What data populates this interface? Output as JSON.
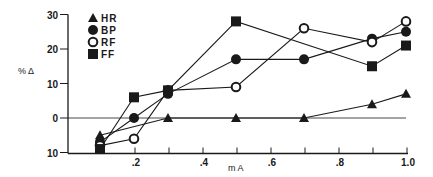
{
  "chart_data": {
    "type": "line",
    "title": "",
    "xlabel": "m A",
    "ylabel": "% Δ",
    "x": [
      0.1,
      0.2,
      0.3,
      0.5,
      0.7,
      0.9,
      1.0
    ],
    "xlim": [
      0.0,
      1.0
    ],
    "ylim": [
      -10,
      30
    ],
    "x_ticks": [
      ".2",
      ".4",
      ".6",
      ".8",
      "1.0"
    ],
    "x_tick_values": [
      0.1,
      0.2,
      0.3,
      0.4,
      0.5,
      0.6,
      0.7,
      0.8,
      0.9,
      1.0
    ],
    "y_ticks": [
      "30",
      "20",
      "10",
      "0",
      "10"
    ],
    "y_tick_values": [
      30,
      20,
      10,
      0,
      -10
    ],
    "grid": false,
    "reference_line": 0,
    "legend_position": "top-left",
    "series": [
      {
        "name": "HR",
        "marker": "filled-triangle",
        "x": [
          0.1,
          0.3,
          0.5,
          0.7,
          0.9,
          1.0
        ],
        "values": [
          -5,
          0,
          0,
          0,
          4,
          7
        ]
      },
      {
        "name": "BP",
        "marker": "filled-circle",
        "x": [
          0.1,
          0.2,
          0.3,
          0.5,
          0.7,
          0.9,
          1.0
        ],
        "values": [
          -7,
          0,
          7,
          17,
          17,
          23,
          25
        ]
      },
      {
        "name": "RF",
        "marker": "open-circle",
        "x": [
          0.1,
          0.2,
          0.3,
          0.5,
          0.7,
          0.9,
          1.0
        ],
        "values": [
          -8,
          -6,
          8,
          9,
          26,
          22,
          28
        ]
      },
      {
        "name": "FF",
        "marker": "filled-square",
        "x": [
          0.1,
          0.2,
          0.3,
          0.5,
          0.9,
          1.0
        ],
        "values": [
          -9,
          6,
          8,
          28,
          15,
          21
        ]
      }
    ]
  },
  "legend": [
    {
      "label": "HR",
      "icon": "filled-triangle"
    },
    {
      "label": "BP",
      "icon": "filled-circle"
    },
    {
      "label": "RF",
      "icon": "open-circle"
    },
    {
      "label": "FF",
      "icon": "filled-square"
    }
  ],
  "axes": {
    "y_title": "% Δ",
    "x_title": "m A",
    "y_labels": [
      "30",
      "20",
      "10",
      "0",
      "10"
    ],
    "x_labels": [
      ".2",
      ".4",
      ".6",
      ".8",
      "1.0"
    ]
  },
  "colors": {
    "ink": "#1a1a1a",
    "background": "#ffffff"
  }
}
